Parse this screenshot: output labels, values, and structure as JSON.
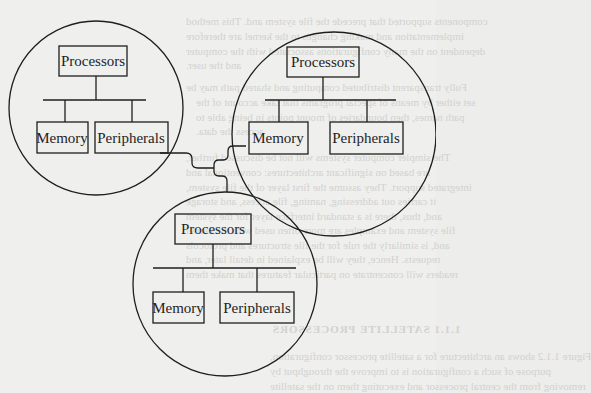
{
  "figure": {
    "type": "network-of-processor-clusters",
    "clusters": [
      {
        "id": "cluster-top-left",
        "processors_label": "Processors",
        "memory_label": "Memory",
        "peripherals_label": "Peripherals"
      },
      {
        "id": "cluster-top-right",
        "processors_label": "Processors",
        "memory_label": "Memory",
        "peripherals_label": "Peripherals"
      },
      {
        "id": "cluster-bottom",
        "processors_label": "Processors",
        "memory_label": "Memory",
        "peripherals_label": "Peripherals"
      }
    ],
    "interconnect": "shared network link joining the three clusters"
  },
  "bleed_through": {
    "lines": [
      "components supported that precede the file system and. This method",
      "implementation and making changes to the kernel are therefore",
      "dependent on the many configurations associated with the computer",
      "and the user.",
      "Fully transparent distributed computing and shared path may be",
      "set either by means of special programs that take account of the",
      "path names, then boundaries of mount points in being able to",
      "access the data.",
      "The simpler computer systems will not be discussed further,",
      "are based on significant architectures: conventional and",
      "integrated support. They assume the first layer of the file system,",
      "it carries out addressing, naming, file access, and storage",
      "and, thus, there is a standard interface layer for the system",
      "file system and examples are more often used with the kernel",
      "and, is similarly the rule for the file structures and protocols",
      "requests. Hence, they will be explained in detail later, and",
      "readers will concentrate on particular features that make them"
    ],
    "heading": "1.1.1 SATELLITE PROCESSORS",
    "after_heading": [
      "Figure 1.1.2 shows an architecture for a satellite processor configuration,",
      "purpose of such a configuration is to improve the throughput by",
      "removing from the central processor and executing them on the satellite"
    ]
  }
}
